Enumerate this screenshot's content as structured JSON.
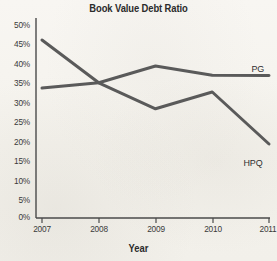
{
  "chart_data": {
    "type": "line",
    "title": "Book Value Debt Ratio",
    "xlabel": "Year",
    "ylabel": "",
    "categories": [
      "2007",
      "2008",
      "2009",
      "2010",
      "2011"
    ],
    "x": [
      2007,
      2008,
      2009,
      2010,
      2011
    ],
    "xlim": [
      2007,
      2011
    ],
    "ylim": [
      0,
      50
    ],
    "y_ticks": [
      0,
      5,
      10,
      15,
      20,
      25,
      30,
      35,
      40,
      45,
      50
    ],
    "y_tick_labels": [
      "0%",
      "5%",
      "10%",
      "15%",
      "20%",
      "25%",
      "30%",
      "35%",
      "40%",
      "45%",
      "50%"
    ],
    "x_tick_labels": [
      "2007",
      "2008",
      "2009",
      "2010",
      "2011"
    ],
    "grid": false,
    "legend_position": "right-inline",
    "series": [
      {
        "name": "HPQ",
        "values": [
          44.5,
          33.8,
          27.3,
          31.5,
          18.5
        ],
        "color": "#5a5a5a"
      },
      {
        "name": "PG",
        "values": [
          32.5,
          33.8,
          38.0,
          35.7,
          35.6
        ],
        "color": "#5a5a5a"
      }
    ],
    "annotations": [
      {
        "text": "PG",
        "series": "PG"
      },
      {
        "text": "HPQ",
        "series": "HPQ"
      }
    ],
    "colors": {
      "background": "#f6f4ef",
      "axis": "#4a4a4a",
      "line": "#5a5a5a",
      "text": "#2b2b2b"
    }
  }
}
